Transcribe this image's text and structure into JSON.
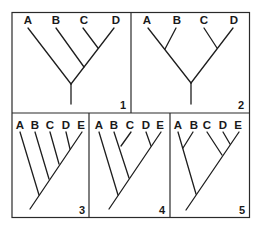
{
  "figure": {
    "panels": [
      {
        "number": "1",
        "taxa": [
          "A",
          "B",
          "C",
          "D"
        ],
        "topology": "(A,(B,(C,D)))"
      },
      {
        "number": "2",
        "taxa": [
          "A",
          "B",
          "C",
          "D"
        ],
        "topology": "((A,B),(C,D))"
      },
      {
        "number": "3",
        "taxa": [
          "A",
          "B",
          "C",
          "D",
          "E"
        ],
        "topology": "(A,(B,(C,(D,E))))"
      },
      {
        "number": "4",
        "taxa": [
          "A",
          "B",
          "C",
          "D",
          "E"
        ],
        "topology": "(A,((B,C),(D,E)))"
      },
      {
        "number": "5",
        "taxa": [
          "A",
          "B",
          "C",
          "D",
          "E"
        ],
        "topology": "((A,B),(C,(D,E)))"
      }
    ]
  },
  "colors": {
    "line": "#1e1e1e",
    "background": "#ffffff"
  }
}
